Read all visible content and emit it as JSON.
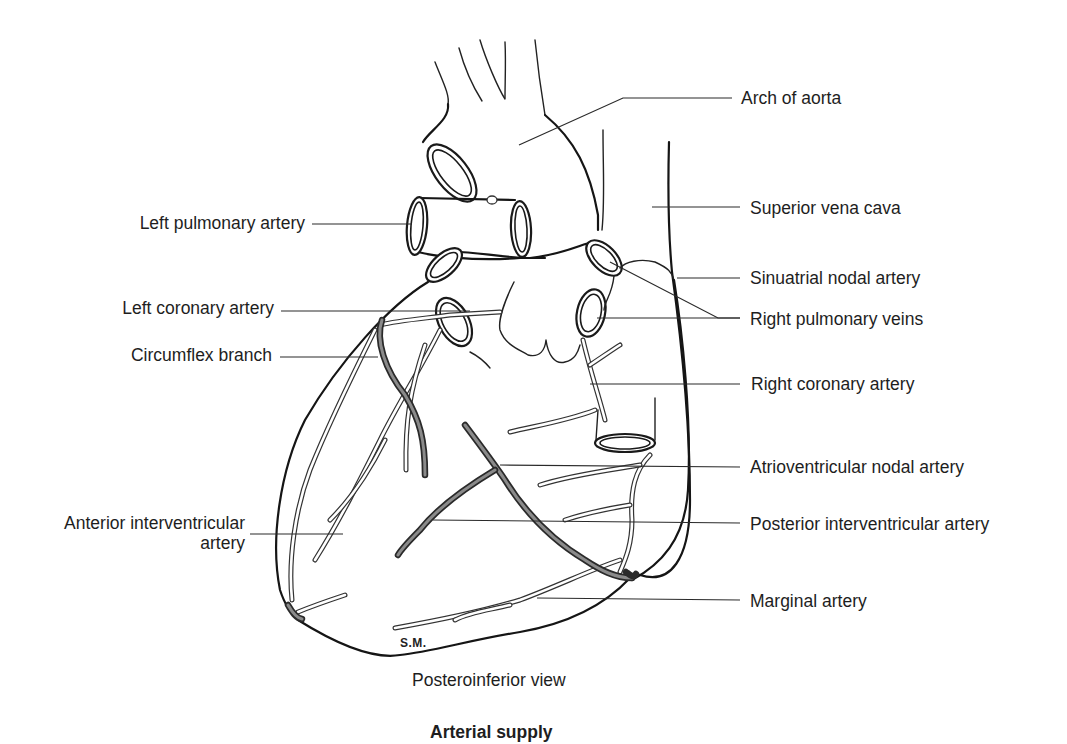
{
  "figure": {
    "title": "Arterial supply",
    "view": "Posteroinferior view",
    "signature": "S.M."
  },
  "labels": {
    "left": [
      {
        "id": "left-pulmonary-artery",
        "text": "Left pulmonary artery"
      },
      {
        "id": "left-coronary-artery",
        "text": "Left coronary artery"
      },
      {
        "id": "circumflex-branch",
        "text": "Circumflex branch"
      },
      {
        "id": "anterior-interventricular-artery",
        "line1": "Anterior interventricular",
        "line2": "artery"
      }
    ],
    "right": [
      {
        "id": "arch-of-aorta",
        "text": "Arch of aorta"
      },
      {
        "id": "superior-vena-cava",
        "text": "Superior vena cava"
      },
      {
        "id": "sinuatrial-nodal-artery",
        "text": "Sinuatrial nodal artery"
      },
      {
        "id": "right-pulmonary-veins",
        "text": "Right pulmonary veins"
      },
      {
        "id": "right-coronary-artery",
        "text": "Right coronary artery"
      },
      {
        "id": "atrioventricular-nodal-artery",
        "text": "Atrioventricular nodal artery"
      },
      {
        "id": "posterior-interventricular-artery",
        "text": "Posterior interventricular artery"
      },
      {
        "id": "marginal-artery",
        "text": "Marginal artery"
      }
    ]
  }
}
